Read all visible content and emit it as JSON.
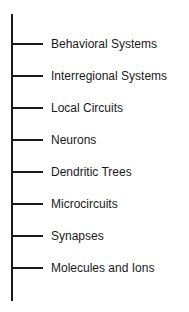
{
  "diagram": {
    "type": "hierarchy-scale",
    "orientation": "vertical",
    "levels": [
      {
        "label": "Behavioral Systems"
      },
      {
        "label": "Interregional Systems"
      },
      {
        "label": "Local Circuits"
      },
      {
        "label": "Neurons"
      },
      {
        "label": "Dendritic Trees"
      },
      {
        "label": "Microcircuits"
      },
      {
        "label": "Synapses"
      },
      {
        "label": "Molecules and Ions"
      }
    ],
    "line_color": "#1a1a1a",
    "text_color": "#1a1a1a"
  }
}
